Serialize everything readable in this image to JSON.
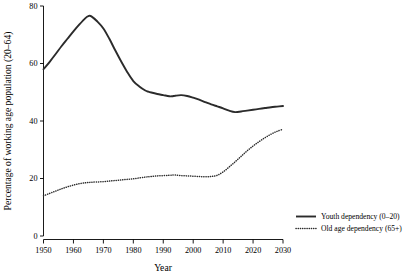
{
  "chart_data": {
    "type": "line",
    "title": "",
    "xlabel": "Year",
    "ylabel": "Percentage of working age population (20–64)",
    "xlim": [
      1950,
      2030
    ],
    "ylim": [
      0,
      80
    ],
    "xticks": [
      1950,
      1960,
      1970,
      1980,
      1990,
      2000,
      2010,
      2020,
      2030
    ],
    "yticks": [
      0,
      20,
      40,
      60,
      80
    ],
    "xtick_labels": [
      "1950",
      "1960",
      "1970",
      "1980",
      "1990",
      "2000",
      "2010",
      "2020",
      "2030"
    ],
    "ytick_labels": [
      "0",
      "20",
      "40",
      "60",
      "80"
    ],
    "grid": false,
    "legend_position": "right-bottom",
    "x": [
      1950,
      1952,
      1954,
      1956,
      1958,
      1960,
      1962,
      1964,
      1965,
      1966,
      1968,
      1970,
      1972,
      1974,
      1976,
      1978,
      1980,
      1982,
      1984,
      1985,
      1986,
      1988,
      1990,
      1992,
      1993,
      1994,
      1996,
      1998,
      2000,
      2002,
      2004,
      2006,
      2008,
      2010,
      2012,
      2014,
      2016,
      2018,
      2020,
      2022,
      2024,
      2026,
      2028,
      2030
    ],
    "series": [
      {
        "name": "Youth dependency (0–20)",
        "style": "solid",
        "color": "#2b2b2b",
        "values": [
          58.0,
          60.5,
          63.2,
          66.0,
          68.6,
          71.2,
          73.6,
          75.8,
          76.5,
          76.4,
          74.6,
          72.2,
          68.6,
          64.5,
          60.6,
          57.0,
          53.9,
          52.0,
          50.6,
          50.2,
          49.9,
          49.4,
          49.0,
          48.6,
          48.6,
          48.8,
          49.0,
          48.7,
          48.1,
          47.4,
          46.6,
          45.8,
          45.1,
          44.4,
          43.6,
          43.1,
          43.3,
          43.6,
          43.9,
          44.2,
          44.5,
          44.8,
          45.0,
          45.2
        ]
      },
      {
        "name": "Old age dependency (65+)",
        "style": "dotted",
        "color": "#2b2b2b",
        "values": [
          14.0,
          14.8,
          15.6,
          16.4,
          17.1,
          17.7,
          18.2,
          18.5,
          18.6,
          18.7,
          18.8,
          18.9,
          19.1,
          19.3,
          19.5,
          19.7,
          19.9,
          20.2,
          20.5,
          20.6,
          20.7,
          20.9,
          21.0,
          21.1,
          21.2,
          21.2,
          21.0,
          20.9,
          20.8,
          20.7,
          20.6,
          20.7,
          21.1,
          22.3,
          24.0,
          25.8,
          27.7,
          29.6,
          31.3,
          32.8,
          34.2,
          35.4,
          36.4,
          37.1
        ]
      }
    ]
  },
  "legend": {
    "items": [
      {
        "label": "Youth dependency (0–20)",
        "style": "solid"
      },
      {
        "label": "Old age dependency (65+)",
        "style": "dotted"
      }
    ]
  },
  "axes": {
    "x_title": "Year",
    "y_title": "Percentage of working age population (20–64)"
  }
}
